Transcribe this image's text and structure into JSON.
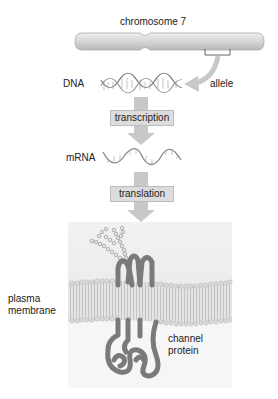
{
  "diagram": {
    "chromosome": {
      "label": "chromosome 7"
    },
    "allele": {
      "label": "allele"
    },
    "dna": {
      "label": "DNA"
    },
    "steps": [
      {
        "label": "transcription"
      },
      {
        "label": "translation"
      }
    ],
    "mrna": {
      "label": "mRNA"
    },
    "membrane": {
      "label_line1": "plasma",
      "label_line2": "membrane"
    },
    "protein": {
      "label_line1": "channel",
      "label_line2": "protein"
    },
    "colors": {
      "chromosome": "#d4d4d4",
      "arrow": "#c8c8c8",
      "step_box": "#dcdcdc",
      "protein": "#7a7a7a",
      "membrane_bg": "#ececec",
      "bilayer": "#d0d0d0"
    }
  }
}
